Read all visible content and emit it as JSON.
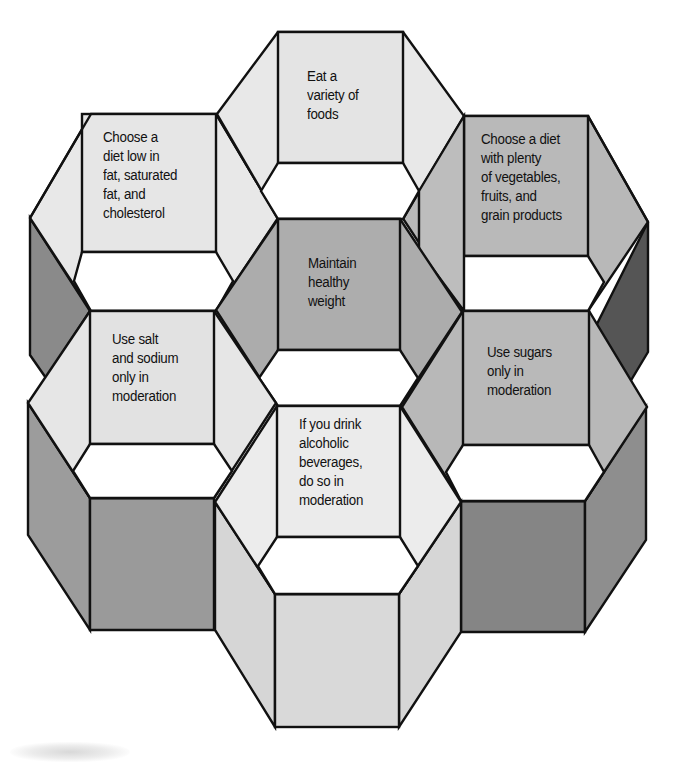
{
  "diagram": {
    "type": "hexagonal-prism-cluster",
    "colors": {
      "outline": "#111111",
      "background": "#ffffff",
      "light": "#e6e6e6",
      "lighter": "#ececec",
      "medium": "#b5b5b5",
      "medium_dark": "#9a9a9a",
      "dark": "#828282",
      "darkest": "#555555",
      "hole": "#ffffff"
    },
    "cells": [
      {
        "id": "top",
        "lines": [
          "Eat a",
          "variety of",
          "foods"
        ]
      },
      {
        "id": "upper-left",
        "lines": [
          "Choose a",
          "diet low in",
          "fat, saturated",
          "fat, and",
          "cholesterol"
        ]
      },
      {
        "id": "upper-right",
        "lines": [
          "Choose a diet",
          "with plenty",
          "of vegetables,",
          "fruits, and",
          "grain products"
        ]
      },
      {
        "id": "center",
        "lines": [
          "Maintain",
          "healthy",
          "weight"
        ]
      },
      {
        "id": "lower-left",
        "lines": [
          "Use salt",
          "and sodium",
          "only in",
          "moderation"
        ]
      },
      {
        "id": "lower-right",
        "lines": [
          "Use sugars",
          "only in",
          "moderation"
        ]
      },
      {
        "id": "bottom",
        "lines": [
          "If you drink",
          "alcoholic",
          "beverages,",
          "do so in",
          "moderation"
        ]
      }
    ]
  }
}
